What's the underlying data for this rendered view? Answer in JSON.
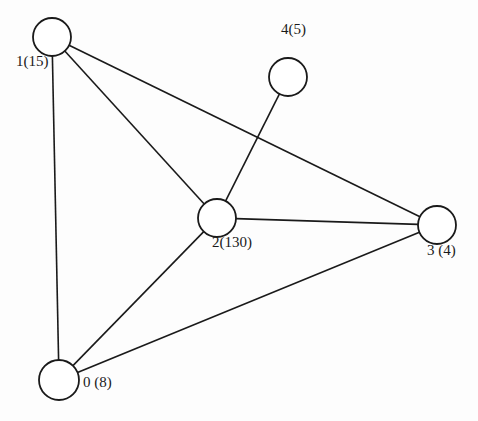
{
  "diagram": {
    "type": "undirected-graph",
    "nodes": [
      {
        "id": "0",
        "label": "0 (8)",
        "weight": 8,
        "cx": 59,
        "cy": 380,
        "r": 20,
        "label_x": 83,
        "label_y": 387
      },
      {
        "id": "1",
        "label": "1(15)",
        "weight": 15,
        "cx": 52,
        "cy": 37,
        "r": 19,
        "label_x": 16,
        "label_y": 66
      },
      {
        "id": "2",
        "label": "2(130)",
        "weight": 130,
        "cx": 217,
        "cy": 218,
        "r": 19,
        "label_x": 212,
        "label_y": 247
      },
      {
        "id": "3",
        "label": "3 (4)",
        "weight": 4,
        "cx": 437,
        "cy": 225,
        "r": 19,
        "label_x": 427,
        "label_y": 255
      },
      {
        "id": "4",
        "label": "4(5)",
        "weight": 5,
        "cx": 288,
        "cy": 77,
        "r": 19,
        "label_x": 281,
        "label_y": 34
      }
    ],
    "edges": [
      {
        "from": "1",
        "to": "0"
      },
      {
        "from": "1",
        "to": "2"
      },
      {
        "from": "1",
        "to": "3"
      },
      {
        "from": "4",
        "to": "2"
      },
      {
        "from": "2",
        "to": "3"
      },
      {
        "from": "2",
        "to": "0"
      },
      {
        "from": "0",
        "to": "3"
      }
    ]
  }
}
